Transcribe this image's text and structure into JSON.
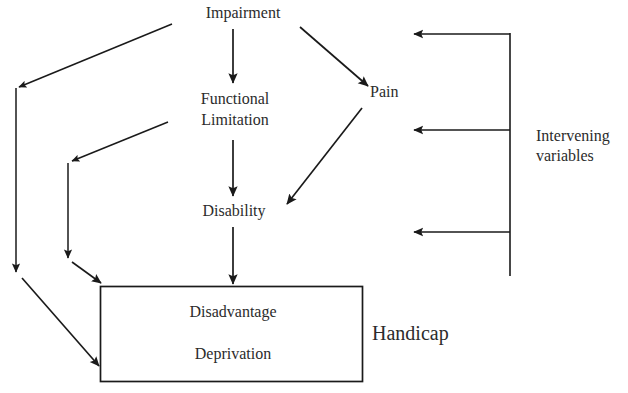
{
  "diagram": {
    "ink_color": "#1a1a1a",
    "text_color": "#2b2b2b",
    "background": "#ffffff",
    "nodes": {
      "impairment": "Impairment",
      "functional_limitation_line1": "Functional",
      "functional_limitation_line2": "Limitation",
      "disability": "Disability",
      "pain": "Pain",
      "handicap": "Handicap",
      "intervening_line1": "Intervening",
      "intervening_line2": "variables"
    },
    "box": {
      "line1": "Disadvantage",
      "line2": "Deprivation"
    }
  }
}
